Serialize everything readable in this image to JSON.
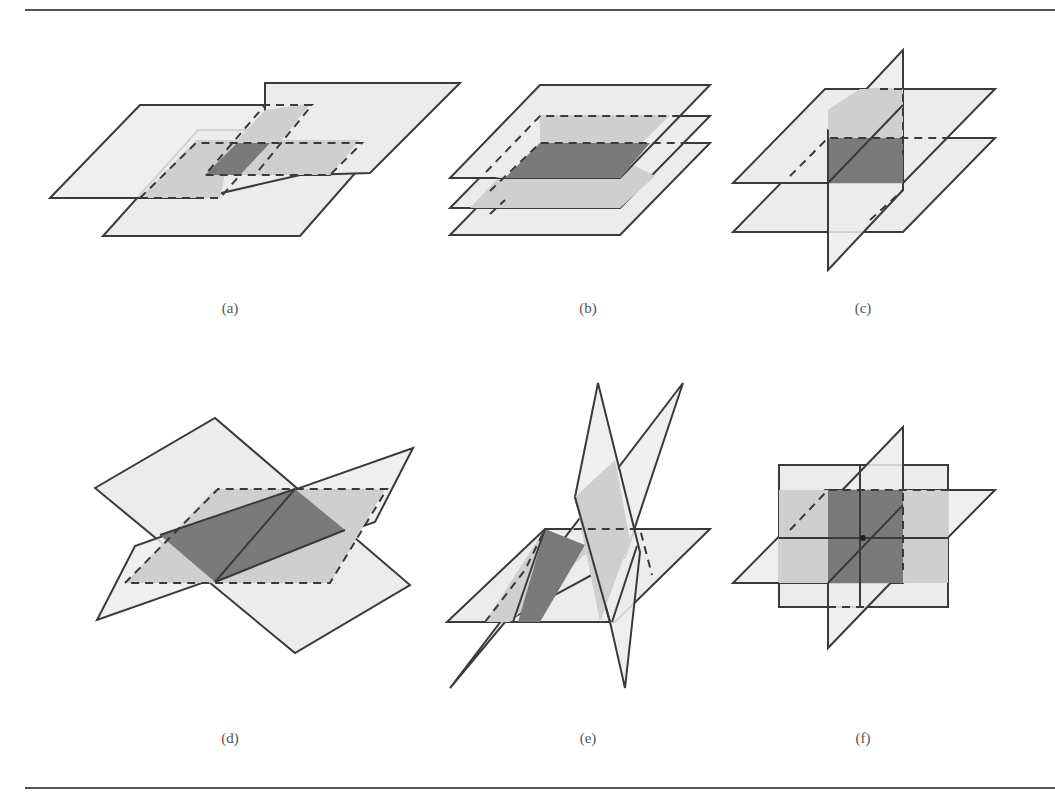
{
  "figure": {
    "panels": [
      {
        "id": "a",
        "label": "(a)",
        "description": "Two horizontal planes offset, overlapping region shaded with dashed outlines"
      },
      {
        "id": "b",
        "label": "(b)",
        "description": "Three stacked parallel horizontal planes"
      },
      {
        "id": "c",
        "label": "(c)",
        "description": "Two parallel horizontal planes cut by one vertical plane"
      },
      {
        "id": "d",
        "label": "(d)",
        "description": "Two tilted planes intersecting along a line with a third dashed plane"
      },
      {
        "id": "e",
        "label": "(e)",
        "description": "Three planes meeting in a triangular prism-like arrangement"
      },
      {
        "id": "f",
        "label": "(f)",
        "description": "Three mutually perpendicular planes meeting at a single point"
      }
    ]
  },
  "colors": {
    "plane_fill": "#ececec",
    "overlap_fill": "#cfcfcf",
    "intersection_fill": "#7a7a7a",
    "stroke": "#3a3a3a",
    "rule": "#555555"
  }
}
